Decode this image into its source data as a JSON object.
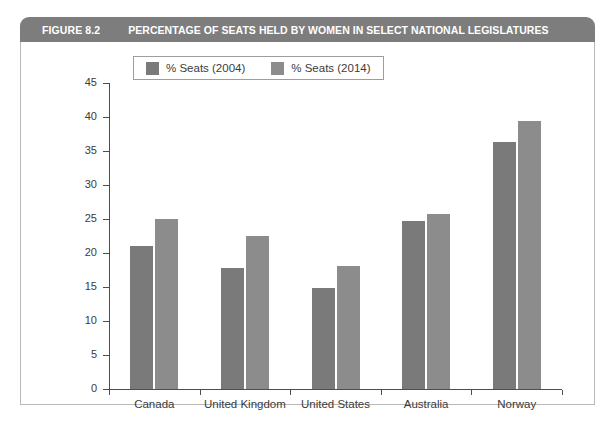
{
  "figure": {
    "number": "FIGURE 8.2",
    "title": "PERCENTAGE OF SEATS HELD BY WOMEN IN SELECT NATIONAL LEGISLATURES",
    "header_bg": "#7d7d7d",
    "header_text_color": "#ffffff",
    "frame_border_color": "#b9b9b9"
  },
  "chart_data": {
    "type": "bar",
    "title": "PERCENTAGE OF SEATS HELD BY WOMEN IN SELECT NATIONAL LEGISLATURES",
    "xlabel": "",
    "ylabel": "",
    "categories": [
      "Canada",
      "United Kingdom",
      "United States",
      "Australia",
      "Norway"
    ],
    "series": [
      {
        "name": "% Seats (2004)",
        "color": "#7a7a7a",
        "values": [
          21.0,
          17.8,
          14.8,
          24.7,
          36.3
        ]
      },
      {
        "name": "% Seats (2014)",
        "color": "#8c8c8c",
        "values": [
          25.0,
          22.5,
          18.1,
          25.8,
          39.4
        ]
      }
    ],
    "ylim": [
      0,
      45
    ],
    "yticks": [
      0,
      5,
      10,
      15,
      20,
      25,
      30,
      35,
      40,
      45
    ],
    "ytick_labels": [
      "0",
      "5",
      "10",
      "15",
      "20",
      "25",
      "30",
      "35",
      "40",
      "45"
    ],
    "grid": false,
    "legend_position": "upper left",
    "axis_color": "#4d4d4d",
    "plot_bg": "#ffffff"
  }
}
